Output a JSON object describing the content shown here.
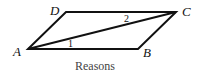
{
  "diagram": {
    "type": "parallelogram-with-diagonal",
    "vertices": {
      "A": {
        "label": "A",
        "x": 28,
        "y": 49
      },
      "B": {
        "label": "B",
        "x": 138,
        "y": 49
      },
      "C": {
        "label": "C",
        "x": 176,
        "y": 12
      },
      "D": {
        "label": "D",
        "x": 66,
        "y": 12
      }
    },
    "diagonal": {
      "from": "A",
      "to": "C"
    },
    "angles": [
      {
        "label": "1",
        "at": "A",
        "between": [
          "AB",
          "AC"
        ]
      },
      {
        "label": "2",
        "at": "C",
        "between": [
          "CD",
          "CA"
        ]
      }
    ],
    "caption": "Reasons"
  },
  "colors": {
    "stroke": "#111111",
    "text": "#111111",
    "caption": "#444444",
    "background": "#ffffff"
  }
}
